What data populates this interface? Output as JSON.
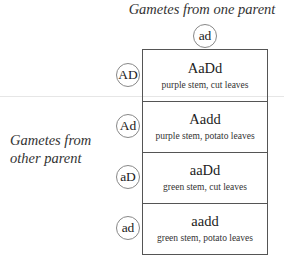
{
  "header": {
    "title": "Gametes from one parent"
  },
  "side_label": {
    "line1": "Gametes from",
    "line2": "other parent"
  },
  "top_gamete": "ad",
  "rows": [
    {
      "gamete": "AD",
      "genotype": "AaDd",
      "phenotype": "purple stem, cut leaves"
    },
    {
      "gamete": "Ad",
      "genotype": "Aadd",
      "phenotype": "purple stem, potato leaves"
    },
    {
      "gamete": "aD",
      "genotype": "aaDd",
      "phenotype": "green stem, cut leaves"
    },
    {
      "gamete": "ad",
      "genotype": "aadd",
      "phenotype": "green stem, potato leaves"
    }
  ]
}
